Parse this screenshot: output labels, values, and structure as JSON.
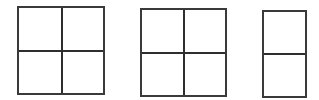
{
  "diagram": {
    "background": "#ffffff",
    "line_color": "#333333",
    "figures": [
      {
        "id": "fig1",
        "shape": "rectangle",
        "rows": 2,
        "cols": 2,
        "cells": 4
      },
      {
        "id": "fig2",
        "shape": "rectangle",
        "rows": 2,
        "cols": 2,
        "cells": 4
      },
      {
        "id": "fig3",
        "shape": "rectangle",
        "rows": 2,
        "cols": 1,
        "cells": 2
      }
    ]
  }
}
